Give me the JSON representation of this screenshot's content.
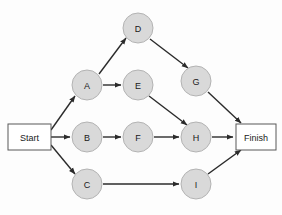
{
  "diagram": {
    "type": "activity-network-diagram",
    "background_color": "#fdfdfd",
    "node_fill_color": "#d9d9d9",
    "node_stroke_color": "#b3b3b3",
    "terminal_fill_color": "#ffffff",
    "terminal_stroke_color": "#595959",
    "edge_color": "#2b2b2b",
    "terminals": [
      {
        "id": "Start",
        "label": "Start",
        "shape": "rect",
        "x": 8,
        "y": 124,
        "w": 43,
        "h": 26
      },
      {
        "id": "Finish",
        "label": "Finish",
        "shape": "rect",
        "x": 236,
        "y": 124,
        "w": 40,
        "h": 26
      }
    ],
    "nodes": [
      {
        "id": "A",
        "label": "A",
        "shape": "circle",
        "cx": 87,
        "cy": 85,
        "r": 15
      },
      {
        "id": "B",
        "label": "B",
        "shape": "circle",
        "cx": 87,
        "cy": 137,
        "r": 15
      },
      {
        "id": "C",
        "label": "C",
        "shape": "circle",
        "cx": 87,
        "cy": 184,
        "r": 15
      },
      {
        "id": "D",
        "label": "D",
        "shape": "circle",
        "cx": 138,
        "cy": 28,
        "r": 15
      },
      {
        "id": "E",
        "label": "E",
        "shape": "circle",
        "cx": 138,
        "cy": 85,
        "r": 15
      },
      {
        "id": "F",
        "label": "F",
        "shape": "circle",
        "cx": 138,
        "cy": 137,
        "r": 15
      },
      {
        "id": "G",
        "label": "G",
        "shape": "circle",
        "cx": 196,
        "cy": 81,
        "r": 15
      },
      {
        "id": "H",
        "label": "H",
        "shape": "circle",
        "cx": 196,
        "cy": 137,
        "r": 15
      },
      {
        "id": "I",
        "label": "I",
        "shape": "circle",
        "cx": 196,
        "cy": 184,
        "r": 15
      }
    ],
    "edges": [
      {
        "from": "Start",
        "to": "A",
        "x1": 51,
        "y1": 130,
        "x2": 75,
        "y2": 96
      },
      {
        "from": "Start",
        "to": "B",
        "x1": 51,
        "y1": 137,
        "x2": 70,
        "y2": 137
      },
      {
        "from": "Start",
        "to": "C",
        "x1": 51,
        "y1": 145,
        "x2": 75,
        "y2": 174
      },
      {
        "from": "A",
        "to": "D",
        "x1": 99,
        "y1": 74,
        "x2": 126,
        "y2": 38
      },
      {
        "from": "A",
        "to": "E",
        "x1": 103,
        "y1": 85,
        "x2": 121,
        "y2": 85
      },
      {
        "from": "B",
        "to": "F",
        "x1": 103,
        "y1": 137,
        "x2": 121,
        "y2": 137
      },
      {
        "from": "C",
        "to": "I",
        "x1": 103,
        "y1": 184,
        "x2": 179,
        "y2": 184
      },
      {
        "from": "D",
        "to": "G",
        "x1": 150,
        "y1": 39,
        "x2": 188,
        "y2": 68
      },
      {
        "from": "E",
        "to": "H",
        "x1": 149,
        "y1": 96,
        "x2": 187,
        "y2": 125
      },
      {
        "from": "F",
        "to": "H",
        "x1": 154,
        "y1": 137,
        "x2": 179,
        "y2": 137
      },
      {
        "from": "G",
        "to": "Finish",
        "x1": 208,
        "y1": 92,
        "x2": 241,
        "y2": 123
      },
      {
        "from": "H",
        "to": "Finish",
        "x1": 212,
        "y1": 137,
        "x2": 233,
        "y2": 137
      },
      {
        "from": "I",
        "to": "Finish",
        "x1": 208,
        "y1": 174,
        "x2": 241,
        "y2": 150
      }
    ]
  }
}
